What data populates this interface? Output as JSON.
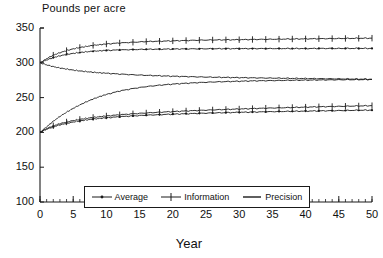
{
  "chart_data": {
    "type": "line",
    "title": "",
    "ylabel": "Pounds per acre",
    "xlabel": "Year",
    "xlim": [
      0,
      50
    ],
    "ylim": [
      100,
      350
    ],
    "xticks": [
      0,
      5,
      10,
      15,
      20,
      25,
      30,
      35,
      40,
      45,
      50
    ],
    "yticks": [
      100,
      150,
      200,
      250,
      300,
      350
    ],
    "minor_x_interval": 1,
    "grid": false,
    "legend_position": "bottom-center-inside",
    "x": [
      0,
      1,
      2,
      3,
      4,
      5,
      6,
      7,
      8,
      9,
      10,
      12,
      14,
      16,
      18,
      20,
      22,
      24,
      26,
      28,
      30,
      32,
      34,
      36,
      38,
      40,
      42,
      44,
      46,
      48,
      50
    ],
    "series": [
      {
        "name": "Information (upper)",
        "legend": "Information",
        "marker": "plus",
        "start": 300,
        "values": [
          300,
          306,
          311,
          314.5,
          317.5,
          320,
          322,
          323.5,
          325,
          326,
          327,
          328.5,
          329.5,
          330.5,
          331,
          331.5,
          332,
          332.5,
          332.8,
          333,
          333.2,
          333.5,
          333.7,
          334,
          334.2,
          334.4,
          334.6,
          334.8,
          335,
          335.2,
          335.4
        ]
      },
      {
        "name": "Average (upper)",
        "legend": "Average",
        "marker": "dot",
        "start": 300,
        "values": [
          300,
          304,
          307.5,
          310,
          312,
          313.5,
          314.8,
          315.8,
          316.6,
          317.2,
          317.8,
          318.5,
          319,
          319.4,
          319.6,
          319.8,
          320,
          320.1,
          320.2,
          320.3,
          320.3,
          320.4,
          320.4,
          320.5,
          320.5,
          320.5,
          320.6,
          320.6,
          320.6,
          320.7,
          320.7
        ]
      },
      {
        "name": "Precision (upper)",
        "legend": "Precision",
        "marker": "none",
        "start": 300,
        "values": [
          300,
          297,
          294.5,
          292.5,
          291,
          289.5,
          288.3,
          287.3,
          286.4,
          285.6,
          285,
          283.8,
          282.8,
          282,
          281.3,
          280.7,
          280.2,
          279.7,
          279.3,
          279,
          278.7,
          278.4,
          278.1,
          277.9,
          277.6,
          277.4,
          277.2,
          277,
          276.8,
          276.6,
          276.4
        ]
      },
      {
        "name": "Precision (lower)",
        "legend": "Precision",
        "marker": "none",
        "start": 200,
        "values": [
          200,
          208,
          216,
          223,
          229,
          234.5,
          239.5,
          244,
          248,
          251.5,
          254.5,
          259.5,
          263,
          265.8,
          267.8,
          269.4,
          270.6,
          271.6,
          272.4,
          273,
          273.5,
          274,
          274.3,
          274.6,
          274.9,
          275.1,
          275.3,
          275.5,
          275.7,
          275.8,
          276
        ]
      },
      {
        "name": "Information (lower)",
        "legend": "Information",
        "marker": "plus",
        "start": 200,
        "values": [
          200,
          205.5,
          209.5,
          212.5,
          215,
          217,
          218.7,
          220.2,
          221.5,
          222.6,
          223.6,
          225.3,
          226.7,
          227.9,
          229,
          229.9,
          230.8,
          231.6,
          232.3,
          233,
          233.6,
          234.2,
          234.8,
          235.3,
          235.8,
          236.3,
          236.8,
          237.2,
          237.6,
          238,
          238.4
        ]
      },
      {
        "name": "Average (lower)",
        "legend": "Average",
        "marker": "dot",
        "start": 200,
        "values": [
          200,
          204.5,
          208,
          210.8,
          213,
          214.9,
          216.5,
          217.9,
          219.1,
          220.1,
          221,
          222.5,
          223.7,
          224.7,
          225.5,
          226.2,
          226.8,
          227.4,
          227.9,
          228.4,
          228.8,
          229.2,
          229.6,
          230,
          230.3,
          230.6,
          230.9,
          231.2,
          231.5,
          231.8,
          232
        ]
      }
    ],
    "legend_entries": [
      {
        "label": "Average",
        "marker": "dot"
      },
      {
        "label": "Information",
        "marker": "plus"
      },
      {
        "label": "Precision",
        "marker": "none"
      }
    ]
  },
  "style": {
    "line_color": "#1a1a1a",
    "axis_color": "#1a1a1a",
    "background": "#ffffff"
  }
}
